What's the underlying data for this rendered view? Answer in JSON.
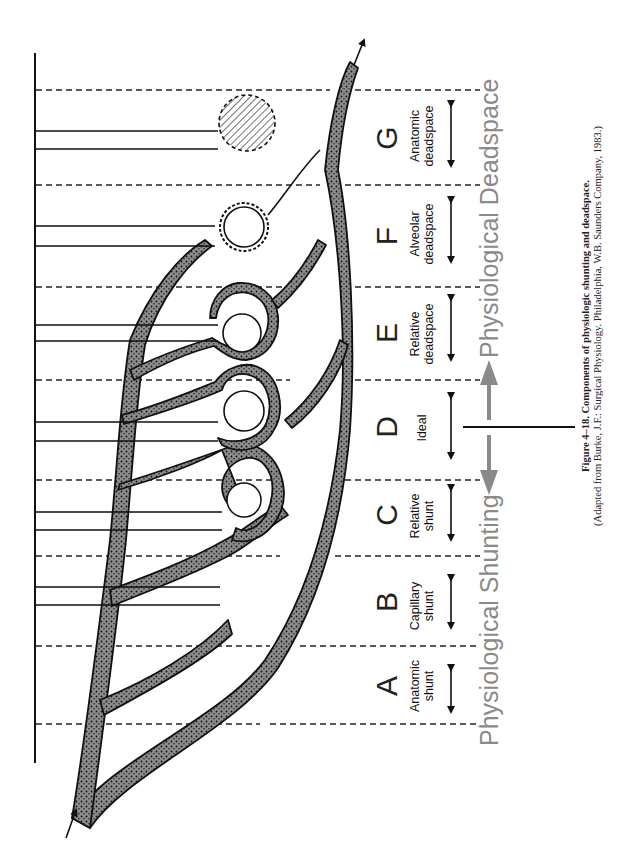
{
  "figure": {
    "caption_title": "Figure 4–18. Components of physiologic shunting and deadspace.",
    "caption_source": "(Adapted from Burke, J.F.: Surgical Physiology. Philadelphia, W.B. Saunders Company, 1983.)"
  },
  "axis_labels": {
    "shunting": "Physiological Shunting",
    "deadspace": "Physiological Deadspace"
  },
  "zones": [
    {
      "letter": "A",
      "line1": "Anatomic",
      "line2": "shunt"
    },
    {
      "letter": "B",
      "line1": "Capillary",
      "line2": "shunt"
    },
    {
      "letter": "C",
      "line1": "Relative",
      "line2": "shunt"
    },
    {
      "letter": "D",
      "line1": "Ideal",
      "line2": ""
    },
    {
      "letter": "E",
      "line1": "Relative",
      "line2": "deadspace"
    },
    {
      "letter": "F",
      "line1": "Alveolar",
      "line2": "deadspace"
    },
    {
      "letter": "G",
      "line1": "Anatomic",
      "line2": "deadspace"
    }
  ],
  "colors": {
    "vessel_fill": "#8c8c8c",
    "outline": "#111111",
    "gray_arrow": "#8a8a8a"
  }
}
